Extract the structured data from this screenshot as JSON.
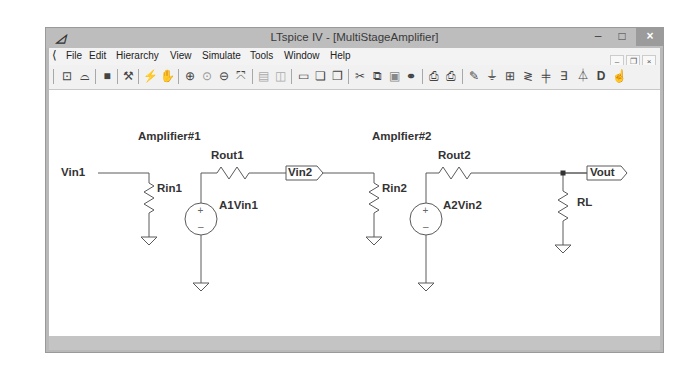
{
  "window": {
    "title": "LTspice IV - [MultiStageAmplifier]",
    "app_icon": "ltspice-logo-icon",
    "buttons": {
      "minimize": "–",
      "maximize": "□",
      "close": "×"
    }
  },
  "menu": {
    "items": [
      {
        "label": "File"
      },
      {
        "label": "Edit"
      },
      {
        "label": "Hierarchy"
      },
      {
        "label": "View"
      },
      {
        "label": "Simulate"
      },
      {
        "label": "Tools"
      },
      {
        "label": "Window"
      },
      {
        "label": "Help"
      }
    ],
    "mdi_buttons": {
      "minimize": "–",
      "restore": "❐",
      "close": "×"
    }
  },
  "toolbar": {
    "icons": [
      {
        "name": "new-schematic-icon",
        "glyph": "⊡"
      },
      {
        "name": "open-icon",
        "glyph": "📂"
      },
      {
        "name": "save-icon",
        "glyph": "■"
      },
      {
        "name": "control-panel-icon",
        "glyph": "⚒"
      },
      {
        "name": "run-icon",
        "glyph": "✈"
      },
      {
        "name": "halt-icon",
        "glyph": "✋"
      },
      {
        "name": "zoom-in-icon",
        "glyph": "⊕"
      },
      {
        "name": "pan-icon",
        "glyph": "🔍"
      },
      {
        "name": "zoom-out-icon",
        "glyph": "⊖"
      },
      {
        "name": "zoom-fit-icon",
        "glyph": "⤧"
      },
      {
        "name": "autorange-icon",
        "glyph": "▤"
      },
      {
        "name": "plot-settings-icon",
        "glyph": "◫"
      },
      {
        "name": "tile-windows-icon",
        "glyph": "▭"
      },
      {
        "name": "cascade-windows-icon",
        "glyph": "❏"
      },
      {
        "name": "close-window-icon",
        "glyph": "❐"
      },
      {
        "name": "cut-icon",
        "glyph": "✂"
      },
      {
        "name": "copy-icon",
        "glyph": "⧉"
      },
      {
        "name": "paste-icon",
        "glyph": "▣"
      },
      {
        "name": "find-icon",
        "glyph": "⚲"
      },
      {
        "name": "print-preview-icon",
        "glyph": "⎙"
      },
      {
        "name": "print-icon",
        "glyph": "🖶"
      },
      {
        "name": "draw-wire-icon",
        "glyph": "✎"
      },
      {
        "name": "ground-icon",
        "glyph": "⏚"
      },
      {
        "name": "label-net-icon",
        "glyph": "⊞"
      },
      {
        "name": "resistor-icon",
        "glyph": "≷"
      },
      {
        "name": "capacitor-icon",
        "glyph": "╪"
      },
      {
        "name": "inductor-icon",
        "glyph": "∃"
      },
      {
        "name": "diode-icon",
        "glyph": "⏄"
      },
      {
        "name": "component-icon",
        "glyph": "D"
      },
      {
        "name": "move-hand-icon",
        "glyph": "☝"
      }
    ]
  },
  "schematic": {
    "labels": {
      "amp1": "Amplifier#1",
      "amp2": "Amplfier#2",
      "vin1": "Vin1",
      "rin1": "Rin1",
      "rout1": "Rout1",
      "a1vin1": "A1Vin1",
      "vin2": "Vin2",
      "rin2": "Rin2",
      "rout2": "Rout2",
      "a2vin2": "A2Vin2",
      "vout": "Vout",
      "rl": "RL"
    },
    "colors": {
      "wire": "#555555",
      "component": "#555555",
      "text": "#333333"
    }
  }
}
